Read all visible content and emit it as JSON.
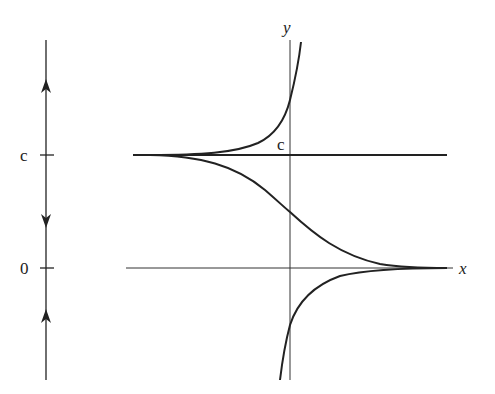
{
  "figure": {
    "phase_line": {
      "tick_labels": [
        "c",
        "0"
      ],
      "equilibria": [
        {
          "label": "c",
          "stability": "unstable"
        },
        {
          "label": "0",
          "stability": "stable"
        }
      ],
      "arrows": [
        "up (above c)",
        "down (between 0 and c)",
        "up (below 0)"
      ]
    },
    "plot": {
      "x_axis_label": "x",
      "y_axis_label": "y",
      "equilibrium_label": "c",
      "curves": [
        "equilibrium solution y = c",
        "solution above c, diverging upward as x increases",
        "solution between 0 and c, decreasing toward 0",
        "solution below 0, rising toward 0 as x increases",
        "equilibrium solution y = 0 (x-axis)"
      ]
    }
  }
}
